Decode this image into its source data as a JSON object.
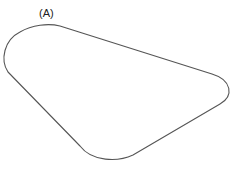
{
  "diagram": {
    "label": "(A)",
    "shape": "rounded-triangle-outline",
    "stroke_color": "#555555",
    "fill_color": "#ffffff"
  }
}
